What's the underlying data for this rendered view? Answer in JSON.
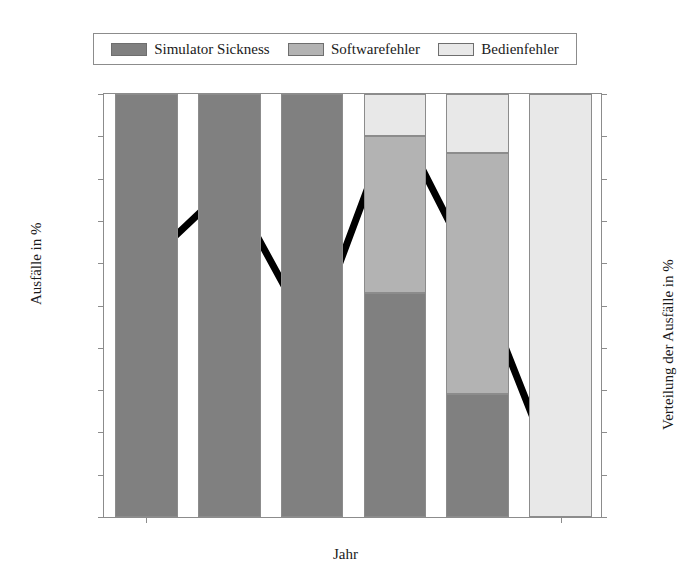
{
  "chart_data": {
    "type": "bar",
    "title": "",
    "subtitle": "",
    "xlabel": "Jahr",
    "ylabel": "Ausfälle in %",
    "ylabel_right": "Verteilung der Ausfälle in %",
    "grid": false,
    "legend_position": "top",
    "categories": [
      "2012",
      "2013",
      "2015",
      "2017",
      "2019",
      "2022"
    ],
    "xtick_labels": [
      "2012",
      "2022"
    ],
    "xtick_label_categories": [
      0,
      5
    ],
    "ylim": [
      0,
      20
    ],
    "yticks": [
      0,
      2,
      4,
      6,
      8,
      10,
      12,
      14,
      16,
      18,
      20
    ],
    "ylim_right": [
      0,
      100
    ],
    "yticks_right": [
      0,
      10,
      20,
      30,
      40,
      50,
      60,
      70,
      80,
      90,
      100
    ],
    "stacked": true,
    "series": [
      {
        "name": "Simulator Sickness",
        "color": "#808080",
        "axis": "right",
        "values": [
          100,
          100,
          100,
          53,
          29,
          0
        ]
      },
      {
        "name": "Softwarefehler",
        "color": "#b3b3b3",
        "axis": "right",
        "values": [
          0,
          0,
          0,
          37,
          57,
          0
        ]
      },
      {
        "name": "Bedienfehler",
        "color": "#e8e8e8",
        "axis": "right",
        "values": [
          0,
          0,
          0,
          10,
          14,
          100
        ]
      }
    ],
    "line_series": {
      "name": "Ausfälle in %",
      "color": "#000000",
      "axis": "left",
      "x": [
        "2012",
        "2013",
        "2015",
        "2017",
        "2019",
        "2022"
      ],
      "values": [
        12.0,
        15.7,
        8.5,
        19.0,
        11.3,
        1.4
      ]
    },
    "annotations": []
  },
  "legend": {
    "entries": [
      {
        "label": "Simulator Sickness",
        "color": "#808080"
      },
      {
        "label": "Softwarefehler",
        "color": "#b3b3b3"
      },
      {
        "label": "Bedienfehler",
        "color": "#e8e8e8"
      }
    ]
  },
  "axes": {
    "left_title": "Ausfälle in %",
    "right_title": "Verteilung der Ausfälle in %",
    "bottom_title": "Jahr"
  },
  "colors": {
    "axis": "#8c8c8c",
    "bar_edge": "#8c8c8c",
    "line": "#000000",
    "background": "#ffffff"
  }
}
